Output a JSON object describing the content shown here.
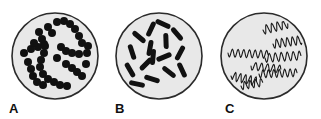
{
  "figure": {
    "background_color": "#ffffff",
    "panels": [
      {
        "id": "A",
        "label": "A",
        "morphology": "cocci-in-chains",
        "description": "Round cocci arranged in winding chains (streptococci)",
        "dish": {
          "fill_color": "#e8e8e8",
          "stroke_color": "#2b2b2b",
          "stroke_width": 1.6,
          "cx": 55,
          "cy": 56,
          "r": 43
        },
        "cell_color": "#111111",
        "cell_count": 44,
        "cell_radius": 4.0
      },
      {
        "id": "B",
        "label": "B",
        "morphology": "bacilli",
        "description": "Rod-shaped bacilli scattered at varied angles",
        "dish": {
          "fill_color": "#e8e8e8",
          "stroke_color": "#2b2b2b",
          "stroke_width": 1.6,
          "cx": 53,
          "cy": 56,
          "r": 43
        },
        "cell_color": "#111111",
        "cell_count": 18,
        "rod_length": 16,
        "rod_width": 5
      },
      {
        "id": "C",
        "label": "C",
        "morphology": "spirilla",
        "description": "Helical spiral-shaped bacteria (spirilla / spirochetes)",
        "dish": {
          "fill_color": "#e8e8e8",
          "stroke_color": "#2b2b2b",
          "stroke_width": 1.6,
          "cx": 53,
          "cy": 56,
          "r": 43
        },
        "cell_color": "#1a1a1a",
        "cell_count": 8,
        "stroke_width": 1.1
      }
    ]
  },
  "chart_data": {
    "type": "diagram",
    "panels": [
      "A",
      "B",
      "C"
    ],
    "panel_morphologies": [
      "cocci in chains",
      "bacilli (rods)",
      "spirilla (spirals)"
    ],
    "cocci_chains": [
      [
        [
          28,
          62
        ],
        [
          31,
          69
        ],
        [
          33,
          76
        ],
        [
          37,
          82
        ],
        [
          43,
          85
        ]
      ],
      [
        [
          24,
          53
        ],
        [
          31,
          49
        ],
        [
          38,
          47
        ],
        [
          44,
          44
        ]
      ],
      [
        [
          39,
          32
        ],
        [
          42,
          39
        ],
        [
          45,
          46
        ],
        [
          44,
          53
        ],
        [
          41,
          60
        ],
        [
          40,
          67
        ],
        [
          43,
          74
        ],
        [
          48,
          79
        ],
        [
          54,
          82
        ],
        [
          60,
          85
        ],
        [
          67,
          86
        ]
      ],
      [
        [
          57,
          22
        ],
        [
          64,
          21
        ],
        [
          70,
          24
        ],
        [
          75,
          29
        ],
        [
          79,
          36
        ],
        [
          82,
          43
        ]
      ],
      [
        [
          61,
          47
        ],
        [
          66,
          51
        ],
        [
          72,
          53
        ],
        [
          79,
          54
        ]
      ],
      [
        [
          66,
          64
        ],
        [
          72,
          68
        ],
        [
          77,
          72
        ],
        [
          82,
          76
        ]
      ],
      [
        [
          48,
          27
        ],
        [
          52,
          33
        ]
      ],
      [
        [
          34,
          43
        ]
      ],
      [
        [
          57,
          58
        ]
      ],
      [
        [
          88,
          46
        ],
        [
          87,
          53
        ]
      ],
      [
        [
          86,
          64
        ]
      ]
    ],
    "bacilli": [
      {
        "x": 26,
        "y": 52,
        "angle": 72
      },
      {
        "x": 24,
        "y": 70,
        "angle": 60
      },
      {
        "x": 31,
        "y": 84,
        "angle": 12
      },
      {
        "x": 33,
        "y": 37,
        "angle": 40
      },
      {
        "x": 45,
        "y": 29,
        "angle": 115
      },
      {
        "x": 44,
        "y": 48,
        "angle": 100
      },
      {
        "x": 40,
        "y": 64,
        "angle": 135
      },
      {
        "x": 46,
        "y": 79,
        "angle": 18
      },
      {
        "x": 56,
        "y": 92,
        "angle": 5
      },
      {
        "x": 57,
        "y": 24,
        "angle": 25
      },
      {
        "x": 60,
        "y": 41,
        "angle": 88
      },
      {
        "x": 58,
        "y": 57,
        "angle": 158
      },
      {
        "x": 63,
        "y": 72,
        "angle": 38
      },
      {
        "x": 71,
        "y": 34,
        "angle": 50
      },
      {
        "x": 74,
        "y": 53,
        "angle": 118
      },
      {
        "x": 76,
        "y": 70,
        "angle": 65
      },
      {
        "x": 79,
        "y": 85,
        "angle": 25
      },
      {
        "x": 47,
        "y": 57,
        "angle": 95
      }
    ],
    "spirals": [
      {
        "x0": 52,
        "y0": 30,
        "len": 34,
        "amp": 4.5,
        "waves": 6,
        "tilt": -14
      },
      {
        "x0": 62,
        "y0": 44,
        "len": 32,
        "amp": 4.5,
        "waves": 6,
        "tilt": -8
      },
      {
        "x0": 17,
        "y0": 53,
        "len": 40,
        "amp": 4.0,
        "waves": 7,
        "tilt": 2
      },
      {
        "x0": 54,
        "y0": 58,
        "len": 36,
        "amp": 4.5,
        "waves": 6,
        "tilt": -4
      },
      {
        "x0": 40,
        "y0": 66,
        "len": 30,
        "amp": 4.0,
        "waves": 5,
        "tilt": 6
      },
      {
        "x0": 48,
        "y0": 74,
        "len": 38,
        "amp": 4.0,
        "waves": 7,
        "tilt": -2
      },
      {
        "x0": 20,
        "y0": 76,
        "len": 26,
        "amp": 4.5,
        "waves": 5,
        "tilt": 12
      },
      {
        "x0": 30,
        "y0": 86,
        "len": 22,
        "amp": 4.0,
        "waves": 4,
        "tilt": -10
      }
    ]
  }
}
